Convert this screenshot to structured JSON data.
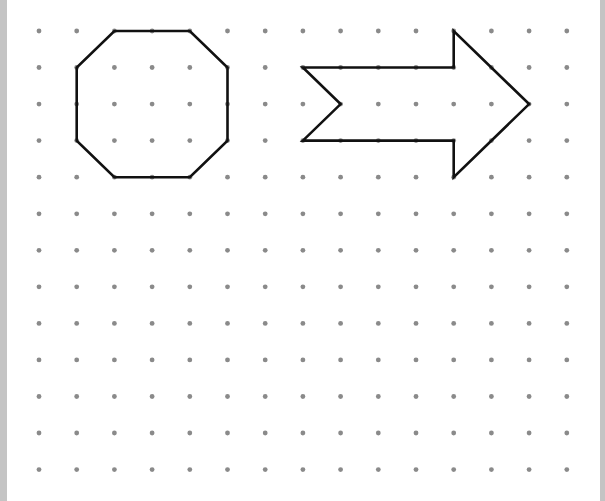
{
  "grid": {
    "columns": 15,
    "rows": 13,
    "origin_x": 39,
    "origin_y": 31,
    "spacing_x": 37.7,
    "spacing_y": 36.55,
    "dot_radius": 2.4,
    "dot_color": "#8a8a8a"
  },
  "shapes": [
    {
      "name": "octagon",
      "stroke": "#111111",
      "stroke_width": 2.6,
      "grid_points": [
        [
          2,
          0
        ],
        [
          4,
          0
        ],
        [
          5,
          1
        ],
        [
          5,
          3
        ],
        [
          4,
          4
        ],
        [
          2,
          4
        ],
        [
          1,
          3
        ],
        [
          1,
          1
        ]
      ]
    },
    {
      "name": "arrow",
      "stroke": "#111111",
      "stroke_width": 2.6,
      "grid_points": [
        [
          7,
          1
        ],
        [
          11,
          1
        ],
        [
          11,
          0
        ],
        [
          13,
          2
        ],
        [
          11,
          4
        ],
        [
          11,
          3
        ],
        [
          7,
          3
        ],
        [
          8,
          2
        ]
      ]
    }
  ],
  "colors": {
    "background": "#ffffff",
    "border": "#c4c4c4"
  }
}
